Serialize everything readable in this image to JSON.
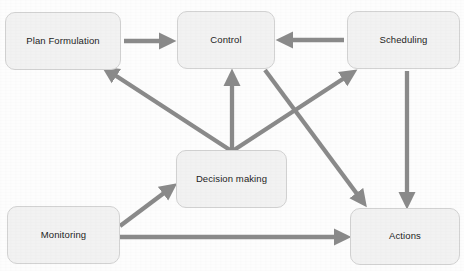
{
  "diagram": {
    "background_color": "#fdfdfd",
    "node_fill": "#f2f2f2",
    "node_border": "#d2d2d2",
    "edge_color": "#8a8a8a",
    "label_color": "#1d1d1d",
    "nodes": [
      {
        "id": "plan-formulation",
        "label": "Plan Formulation",
        "x": 5,
        "y": 12,
        "w": 116,
        "h": 58
      },
      {
        "id": "control",
        "label": "Control",
        "x": 177,
        "y": 11,
        "w": 98,
        "h": 58
      },
      {
        "id": "scheduling",
        "label": "Scheduling",
        "x": 347,
        "y": 11,
        "w": 113,
        "h": 58
      },
      {
        "id": "decision-making",
        "label": "Decision making",
        "x": 176,
        "y": 150,
        "w": 111,
        "h": 58
      },
      {
        "id": "monitoring",
        "label": "Monitoring",
        "x": 7,
        "y": 206,
        "w": 113,
        "h": 58
      },
      {
        "id": "actions",
        "label": "Actions",
        "x": 350,
        "y": 208,
        "w": 110,
        "h": 57
      }
    ],
    "edges": [
      {
        "id": "plan-formulation-to-control",
        "from": "plan-formulation",
        "to": "control",
        "shape": "horizontal"
      },
      {
        "id": "scheduling-to-control",
        "from": "scheduling",
        "to": "control",
        "shape": "horizontal"
      },
      {
        "id": "decision-making-to-control",
        "from": "decision-making",
        "to": "control",
        "shape": "vertical"
      },
      {
        "id": "decision-making-to-plan",
        "from": "decision-making",
        "to": "plan-formulation",
        "shape": "diagonal"
      },
      {
        "id": "decision-making-to-scheduling",
        "from": "decision-making",
        "to": "scheduling",
        "shape": "diagonal"
      },
      {
        "id": "control-to-actions",
        "from": "control",
        "to": "actions",
        "shape": "diagonal"
      },
      {
        "id": "scheduling-to-actions",
        "from": "scheduling",
        "to": "actions",
        "shape": "vertical"
      },
      {
        "id": "monitoring-to-decision-making",
        "from": "monitoring",
        "to": "decision-making",
        "shape": "diagonal"
      },
      {
        "id": "monitoring-to-actions",
        "from": "monitoring",
        "to": "actions",
        "shape": "horizontal"
      }
    ]
  }
}
